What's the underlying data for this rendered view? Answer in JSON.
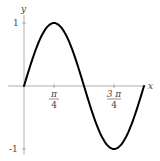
{
  "chart_data": {
    "type": "line",
    "title": "",
    "function": "y = sin(2x)",
    "xlabel": "x",
    "ylabel": "y",
    "xlim": [
      0,
      3.14159
    ],
    "ylim": [
      -1,
      1
    ],
    "grid": false,
    "x_ticks": [
      {
        "value": 0.7854,
        "numerator": "π",
        "denominator": "4"
      },
      {
        "value": 2.3562,
        "numerator": "3 π",
        "denominator": "4"
      }
    ],
    "y_ticks": [
      {
        "value": 1,
        "label": "1"
      },
      {
        "value": -1,
        "label": "-1"
      }
    ],
    "series": [
      {
        "name": "sin(2x)",
        "color": "#000000",
        "x": [
          0,
          0.3927,
          0.7854,
          1.1781,
          1.5708,
          1.9635,
          2.3562,
          2.7489,
          3.1416
        ],
        "y": [
          0,
          0.7071,
          1,
          0.7071,
          0,
          -0.7071,
          -1,
          -0.7071,
          0
        ]
      }
    ]
  },
  "axes": {
    "x_label": "x",
    "y_label": "y",
    "y_tick_top": "1",
    "y_tick_bottom": "-1",
    "x_tick1_num": "π",
    "x_tick1_den": "4",
    "x_tick2_num": "3 π",
    "x_tick2_den": "4"
  }
}
